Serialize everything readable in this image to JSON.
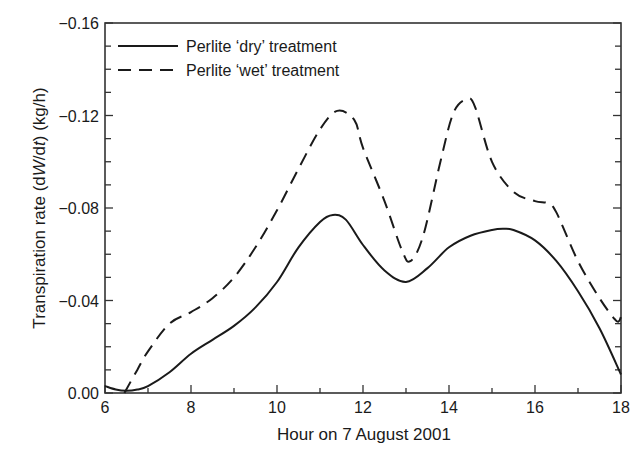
{
  "chart_data": {
    "type": "line",
    "title": "",
    "xlabel": "Hour on 7 August 2001",
    "ylabel": "Transpiration rate (dW/dt) (kg/h)",
    "ylabel_parts": {
      "prefix": "Transpiration rate (d",
      "W": "W",
      "slash": "/d",
      "t": "t",
      "suffix": ") (kg/h)"
    },
    "xlim": [
      6,
      18
    ],
    "ylim": [
      0.0,
      -0.16
    ],
    "x_ticks": [
      6,
      8,
      10,
      12,
      14,
      16,
      18
    ],
    "x_tick_labels": [
      "6",
      "8",
      "10",
      "12",
      "14",
      "16",
      "18"
    ],
    "x_minor_step": 1,
    "y_ticks": [
      0.0,
      -0.04,
      -0.08,
      -0.12,
      -0.16
    ],
    "y_tick_labels": [
      "0.00",
      "−0.04",
      "−0.08",
      "−0.12",
      "−0.16"
    ],
    "y_minor_step": 0.01,
    "grid": false,
    "legend_position": "upper left",
    "series": [
      {
        "name": "Perlite ‘dry’ treatment",
        "style": "solid",
        "color": "#1a1a1a",
        "x": [
          6.0,
          6.25,
          6.5,
          6.75,
          7.0,
          7.5,
          8.0,
          8.5,
          9.0,
          9.5,
          10.0,
          10.5,
          11.0,
          11.3,
          11.6,
          12.0,
          12.5,
          13.0,
          13.5,
          14.0,
          14.5,
          15.0,
          15.25,
          15.5,
          16.0,
          16.5,
          17.0,
          17.5,
          18.0
        ],
        "y": [
          -0.003,
          -0.0015,
          -0.001,
          -0.0015,
          -0.003,
          -0.009,
          -0.017,
          -0.023,
          -0.029,
          -0.037,
          -0.048,
          -0.063,
          -0.074,
          -0.077,
          -0.075,
          -0.064,
          -0.053,
          -0.048,
          -0.054,
          -0.063,
          -0.068,
          -0.0705,
          -0.071,
          -0.0705,
          -0.066,
          -0.057,
          -0.044,
          -0.028,
          -0.008
        ]
      },
      {
        "name": "Perlite ‘wet’ treatment",
        "style": "dashed",
        "color": "#1a1a1a",
        "x": [
          6.45,
          6.75,
          7.0,
          7.5,
          8.0,
          8.5,
          9.0,
          9.5,
          10.0,
          10.5,
          11.0,
          11.4,
          11.8,
          12.0,
          12.5,
          12.9,
          13.1,
          13.4,
          13.8,
          14.1,
          14.4,
          14.6,
          15.0,
          15.5,
          16.0,
          16.3,
          16.5,
          17.0,
          17.5,
          17.85,
          17.95,
          18.0
        ],
        "y": [
          0.0,
          -0.01,
          -0.018,
          -0.03,
          -0.035,
          -0.041,
          -0.05,
          -0.063,
          -0.079,
          -0.097,
          -0.114,
          -0.122,
          -0.118,
          -0.106,
          -0.083,
          -0.062,
          -0.057,
          -0.068,
          -0.1,
          -0.121,
          -0.127,
          -0.124,
          -0.1,
          -0.087,
          -0.083,
          -0.082,
          -0.078,
          -0.057,
          -0.041,
          -0.032,
          -0.031,
          -0.033
        ]
      }
    ]
  }
}
